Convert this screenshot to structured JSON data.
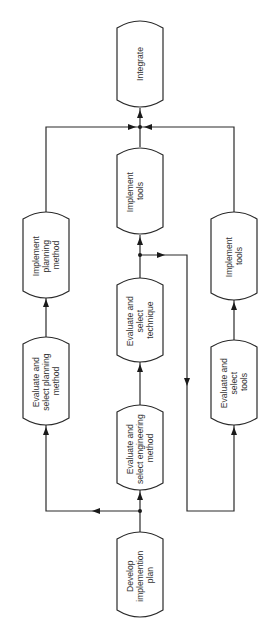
{
  "diagram": {
    "type": "flowchart",
    "orientation": "rotated-90-ccw",
    "nodes": [
      {
        "id": "develop",
        "lines": [
          "Develop",
          "implemention",
          "plan"
        ]
      },
      {
        "id": "eval_eng",
        "lines": [
          "Evaluate and",
          "select engineering",
          "method"
        ]
      },
      {
        "id": "eval_plan",
        "lines": [
          "Evaluate and",
          "select planning",
          "method"
        ]
      },
      {
        "id": "eval_tools",
        "lines": [
          "Evaluate and",
          "select",
          "tools"
        ]
      },
      {
        "id": "eval_tech",
        "lines": [
          "Evaluate and",
          "select",
          "technique"
        ]
      },
      {
        "id": "impl_plan",
        "lines": [
          "Implement",
          "planning",
          "method"
        ]
      },
      {
        "id": "impl_tools",
        "lines": [
          "Implement",
          "tools"
        ]
      },
      {
        "id": "impl_method",
        "lines": [
          "Implement",
          "method and",
          "technique"
        ]
      },
      {
        "id": "integrate",
        "lines": [
          "Integrate"
        ]
      }
    ],
    "edges": [
      {
        "from": "develop",
        "to": "eval_eng"
      },
      {
        "from": "develop",
        "to": "eval_plan"
      },
      {
        "from": "develop",
        "to": "eval_tools"
      },
      {
        "from": "eval_eng",
        "to": "eval_tech"
      },
      {
        "from": "eval_tech",
        "to": "impl_method"
      },
      {
        "from": "eval_tech",
        "to": "eval_tools"
      },
      {
        "from": "eval_plan",
        "to": "impl_plan"
      },
      {
        "from": "eval_tools",
        "to": "impl_tools"
      },
      {
        "from": "impl_plan",
        "to": "integrate"
      },
      {
        "from": "impl_method",
        "to": "integrate"
      },
      {
        "from": "impl_tools",
        "to": "integrate"
      }
    ]
  }
}
